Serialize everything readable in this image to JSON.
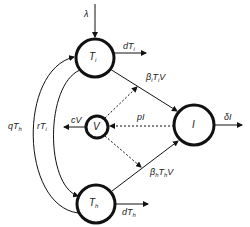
{
  "diagram": {
    "type": "compartmental-model",
    "colors": {
      "stroke": "#111111",
      "background": "#ffffff",
      "text": "#222222"
    },
    "nodes": [
      {
        "id": "Ti",
        "label": "T",
        "sub": "i"
      },
      {
        "id": "Th",
        "label": "T",
        "sub": "h"
      },
      {
        "id": "V",
        "label": "V",
        "sub": ""
      },
      {
        "id": "I",
        "label": "I",
        "sub": ""
      }
    ],
    "edges": [
      {
        "id": "lambda",
        "from": "source",
        "to": "Ti",
        "label": "λ",
        "style": "solid"
      },
      {
        "id": "dTi",
        "from": "Ti",
        "to": "sink",
        "label_main": "dT",
        "label_sub": "i",
        "style": "solid"
      },
      {
        "id": "betaiTiV",
        "from": "Ti",
        "to": "I",
        "label_a": "β",
        "label_a_sub": "i",
        "label_b": "T",
        "label_b_sub": "i",
        "label_c": "V",
        "style": "solid"
      },
      {
        "id": "betahThV",
        "from": "Th",
        "to": "I",
        "label_a": "β",
        "label_a_sub": "h",
        "label_b": "T",
        "label_b_sub": "h",
        "label_c": "V",
        "style": "solid"
      },
      {
        "id": "dTh",
        "from": "Th",
        "to": "sink",
        "label_main": "dT",
        "label_sub": "h",
        "style": "solid"
      },
      {
        "id": "deltaI",
        "from": "I",
        "to": "sink",
        "label": "δI",
        "style": "solid"
      },
      {
        "id": "pI",
        "from": "I",
        "to": "V",
        "label": "pI",
        "style": "dashed"
      },
      {
        "id": "cV",
        "from": "V",
        "to": "sink",
        "label": "cV",
        "style": "solid"
      },
      {
        "id": "V_Ti",
        "from": "V",
        "to": "betaiTiV",
        "label": "",
        "style": "dashed"
      },
      {
        "id": "V_Th",
        "from": "V",
        "to": "betahThV",
        "label": "",
        "style": "dashed"
      },
      {
        "id": "qTh",
        "from": "Th",
        "to": "Ti",
        "label_main": "qT",
        "label_sub": "h",
        "style": "solid"
      },
      {
        "id": "rTi",
        "from": "Ti",
        "to": "Th",
        "label_main": "rT",
        "label_sub": "i",
        "style": "solid"
      }
    ]
  }
}
